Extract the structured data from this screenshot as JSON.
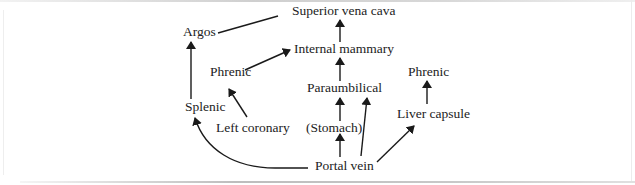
{
  "diagram": {
    "type": "flow",
    "nodes": {
      "superior_vena_cava": "Superior vena cava",
      "argos": "Argos",
      "internal_mammary": "Internal mammary",
      "phrenic_left": "Phrenic",
      "phrenic_right": "Phrenic",
      "paraumbilical": "Paraumbilical",
      "splenic": "Splenic",
      "liver_capsule": "Liver capsule",
      "left_coronary": "Left coronary",
      "stomach": "(Stomach)",
      "portal_vein": "Portal vein"
    },
    "edges": [
      {
        "from": "Argos",
        "to": "Superior vena cava",
        "style": "line"
      },
      {
        "from": "Internal mammary",
        "to": "Superior vena cava",
        "style": "arrow"
      },
      {
        "from": "Phrenic",
        "to": "Internal mammary",
        "style": "arrow"
      },
      {
        "from": "Paraumbilical",
        "to": "Internal mammary",
        "style": "arrow"
      },
      {
        "from": "Splenic",
        "to": "Argos",
        "style": "arrow"
      },
      {
        "from": "Left coronary",
        "to": "Phrenic",
        "style": "arrow"
      },
      {
        "from": "(Stomach)",
        "to": "Paraumbilical",
        "style": "arrow"
      },
      {
        "from": "Portal vein",
        "to": "(Stomach)",
        "style": "arrow"
      },
      {
        "from": "Portal vein",
        "to": "Paraumbilical",
        "style": "arrow"
      },
      {
        "from": "Portal vein",
        "to": "Splenic",
        "style": "curved-arrow"
      },
      {
        "from": "Portal vein",
        "to": "Liver capsule",
        "style": "arrow"
      },
      {
        "from": "Liver capsule",
        "to": "Phrenic",
        "style": "arrow"
      }
    ],
    "colors": {
      "text": "#222222",
      "line": "#1a1a1a",
      "background": "#ffffff"
    }
  }
}
